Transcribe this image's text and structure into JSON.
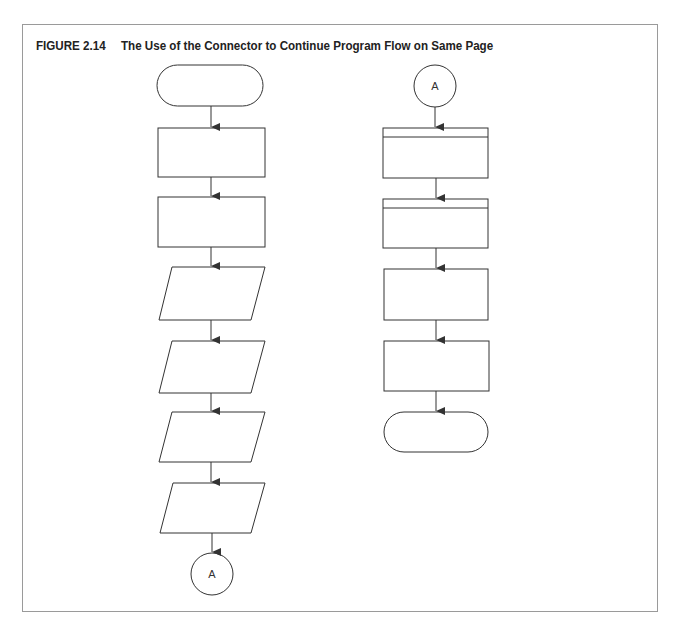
{
  "figure": {
    "number": "FIGURE 2.14",
    "title": "The Use of the Connector to Continue Program Flow on Same Page"
  },
  "left_column": {
    "shapes": [
      {
        "type": "terminal",
        "label": ""
      },
      {
        "type": "process",
        "label": ""
      },
      {
        "type": "process",
        "label": ""
      },
      {
        "type": "input-output",
        "label": ""
      },
      {
        "type": "input-output",
        "label": ""
      },
      {
        "type": "input-output",
        "label": ""
      },
      {
        "type": "input-output",
        "label": ""
      },
      {
        "type": "connector",
        "label": "A"
      }
    ]
  },
  "right_column": {
    "shapes": [
      {
        "type": "connector",
        "label": "A"
      },
      {
        "type": "predefined-process",
        "label": ""
      },
      {
        "type": "predefined-process",
        "label": ""
      },
      {
        "type": "process",
        "label": ""
      },
      {
        "type": "process",
        "label": ""
      },
      {
        "type": "terminal",
        "label": ""
      }
    ]
  },
  "colors": {
    "stroke": "#333333",
    "frame": "#9a9a9a",
    "title": "#222222"
  }
}
